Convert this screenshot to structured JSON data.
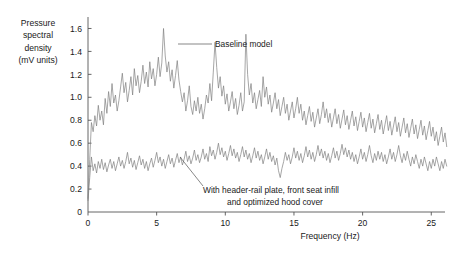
{
  "figure": {
    "background_color": "#ffffff",
    "axis_color": "#555555",
    "series_color": "#808080",
    "text_color": "#1a1a1a"
  },
  "ylabel_lines": [
    "Pressure",
    "spectral",
    "density",
    "(mV units)"
  ],
  "chart_data": {
    "type": "line",
    "title": "",
    "xlabel": "Frequency (Hz)",
    "ylabel": "Pressure spectral density (mV units)",
    "xlim": [
      0,
      26
    ],
    "ylim": [
      0,
      1.7
    ],
    "xticks": [
      0,
      5,
      10,
      15,
      20,
      25
    ],
    "xtick_labels": [
      "0",
      "5",
      "10",
      "15",
      "20",
      "25"
    ],
    "yticks": [
      0,
      0.2,
      0.4,
      0.6,
      0.8,
      1.0,
      1.2,
      1.4,
      1.6
    ],
    "ytick_labels": [
      "0",
      "0.2",
      "0.4",
      "0.6",
      "0.8",
      "1.0",
      "1.2",
      "1.4",
      "1.6"
    ],
    "grid": false,
    "legend_position": "inline-annotations",
    "annotations": [
      {
        "label": "Baseline model",
        "text_x": 215,
        "text_y": 47,
        "leader": [
          178,
          44,
          212,
          44
        ]
      },
      {
        "label_lines": [
          "With header-rail plate, front seat infill",
          "and optimized hood cover"
        ],
        "text_x": 203,
        "text_y": 193,
        "leader": [
          180,
          157,
          203,
          186
        ]
      }
    ],
    "series": [
      {
        "name": "Baseline model",
        "x_start": 0.0,
        "x_step": 0.125,
        "values": [
          0.12,
          0.46,
          0.78,
          0.7,
          0.84,
          0.75,
          0.93,
          0.8,
          0.88,
          0.76,
          0.99,
          0.86,
          1.05,
          0.92,
          1.12,
          0.95,
          1.02,
          0.88,
          0.97,
          1.09,
          1.21,
          1.04,
          1.13,
          0.96,
          1.06,
          1.18,
          1.02,
          1.25,
          1.1,
          1.19,
          1.04,
          1.14,
          1.28,
          1.12,
          1.22,
          1.09,
          1.31,
          1.16,
          1.25,
          1.1,
          1.2,
          1.35,
          1.18,
          1.3,
          1.6,
          1.36,
          1.22,
          1.31,
          1.14,
          1.24,
          1.08,
          1.19,
          1.32,
          1.15,
          1.05,
          0.96,
          1.04,
          0.88,
          0.97,
          1.1,
          0.92,
          0.85,
          0.97,
          0.88,
          1.0,
          0.86,
          0.94,
          0.81,
          0.9,
          1.02,
          0.95,
          1.12,
          0.97,
          1.22,
          1.48,
          1.26,
          1.08,
          1.18,
          1.01,
          1.1,
          0.94,
          1.03,
          0.88,
          0.96,
          1.05,
          0.9,
          0.99,
          0.85,
          0.93,
          1.04,
          0.88,
          0.96,
          1.55,
          1.2,
          1.02,
          1.12,
          0.95,
          1.04,
          0.9,
          0.98,
          1.06,
          0.92,
          1.18,
          1.0,
          1.09,
          0.94,
          1.02,
          0.87,
          0.95,
          1.04,
          0.9,
          0.98,
          0.84,
          0.92,
          1.0,
          0.86,
          0.94,
          0.8,
          0.88,
          0.96,
          0.82,
          0.9,
          1.0,
          0.86,
          0.94,
          0.8,
          0.88,
          0.76,
          0.84,
          0.92,
          0.79,
          0.87,
          0.74,
          0.82,
          0.9,
          0.77,
          0.85,
          0.96,
          0.82,
          0.9,
          0.78,
          0.86,
          0.74,
          0.82,
          0.9,
          0.77,
          0.85,
          0.73,
          0.81,
          0.89,
          0.76,
          0.84,
          0.72,
          0.8,
          0.88,
          0.75,
          0.83,
          0.71,
          0.79,
          0.87,
          0.74,
          0.82,
          0.7,
          0.78,
          0.86,
          0.73,
          0.81,
          0.69,
          0.77,
          0.85,
          0.72,
          0.8,
          0.68,
          0.76,
          0.84,
          0.71,
          0.79,
          0.67,
          0.75,
          0.83,
          0.7,
          0.78,
          0.66,
          0.74,
          0.82,
          0.69,
          0.77,
          0.65,
          0.73,
          0.81,
          0.68,
          0.76,
          0.64,
          0.72,
          0.8,
          0.67,
          0.75,
          0.63,
          0.71,
          0.79,
          0.66,
          0.74,
          0.62,
          0.7,
          0.58,
          0.66,
          0.74,
          0.61,
          0.69,
          0.57
        ]
      },
      {
        "name": "With header-rail plate, front seat infill and optimized hood cover",
        "x_start": 0.0,
        "x_step": 0.125,
        "values": [
          0.1,
          0.3,
          0.48,
          0.36,
          0.42,
          0.34,
          0.44,
          0.38,
          0.46,
          0.37,
          0.43,
          0.35,
          0.41,
          0.46,
          0.38,
          0.44,
          0.36,
          0.42,
          0.48,
          0.4,
          0.45,
          0.38,
          0.44,
          0.52,
          0.42,
          0.47,
          0.39,
          0.45,
          0.37,
          0.43,
          0.49,
          0.41,
          0.46,
          0.38,
          0.44,
          0.36,
          0.42,
          0.47,
          0.39,
          0.45,
          0.52,
          0.43,
          0.48,
          0.4,
          0.46,
          0.38,
          0.44,
          0.5,
          0.42,
          0.47,
          0.39,
          0.45,
          0.51,
          0.43,
          0.48,
          0.41,
          0.46,
          0.53,
          0.44,
          0.49,
          0.42,
          0.47,
          0.54,
          0.45,
          0.5,
          0.43,
          0.48,
          0.55,
          0.46,
          0.51,
          0.44,
          0.57,
          0.49,
          0.54,
          0.46,
          0.52,
          0.6,
          0.5,
          0.56,
          0.48,
          0.53,
          0.45,
          0.51,
          0.58,
          0.49,
          0.55,
          0.47,
          0.52,
          0.44,
          0.5,
          0.57,
          0.48,
          0.54,
          0.46,
          0.51,
          0.43,
          0.49,
          0.56,
          0.47,
          0.53,
          0.45,
          0.5,
          0.42,
          0.48,
          0.55,
          0.46,
          0.52,
          0.44,
          0.49,
          0.41,
          0.47,
          0.36,
          0.3,
          0.38,
          0.44,
          0.52,
          0.45,
          0.5,
          0.42,
          0.48,
          0.56,
          0.47,
          0.53,
          0.45,
          0.51,
          0.43,
          0.49,
          0.57,
          0.48,
          0.54,
          0.46,
          0.52,
          0.44,
          0.5,
          0.58,
          0.49,
          0.55,
          0.47,
          0.53,
          0.45,
          0.51,
          0.43,
          0.49,
          0.56,
          0.47,
          0.53,
          0.45,
          0.51,
          0.59,
          0.5,
          0.56,
          0.48,
          0.54,
          0.46,
          0.52,
          0.44,
          0.5,
          0.42,
          0.48,
          0.55,
          0.46,
          0.52,
          0.44,
          0.5,
          0.58,
          0.49,
          0.43,
          0.51,
          0.45,
          0.53,
          0.46,
          0.52,
          0.44,
          0.5,
          0.42,
          0.48,
          0.55,
          0.46,
          0.52,
          0.44,
          0.5,
          0.58,
          0.49,
          0.43,
          0.51,
          0.45,
          0.53,
          0.46,
          0.4,
          0.48,
          0.42,
          0.5,
          0.44,
          0.38,
          0.46,
          0.4,
          0.48,
          0.42,
          0.36,
          0.44,
          0.38,
          0.46,
          0.4,
          0.48,
          0.42,
          0.36,
          0.44,
          0.38,
          0.46,
          0.4
        ]
      }
    ]
  }
}
